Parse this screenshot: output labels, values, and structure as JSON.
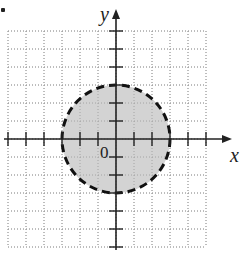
{
  "figure": {
    "bullet": true,
    "axes": {
      "x_label": "x",
      "y_label": "y",
      "origin_label": "0"
    },
    "grid": {
      "x_min": -6,
      "x_max": 5,
      "y_min": -6,
      "y_max": 6,
      "spacing_px": 18,
      "style": "dotted"
    },
    "circle": {
      "center": [
        0,
        0
      ],
      "radius": 3,
      "boundary": "dashed",
      "fill": "#d3d3d3",
      "inequality": "x^2 + y^2 < 9"
    },
    "colors": {
      "axis": "#222222",
      "grid": "#aaaaaa",
      "shade": "#d3d3d3"
    }
  },
  "chart_data": {
    "type": "region",
    "title": "",
    "xlabel": "x",
    "ylabel": "y",
    "xlim": [
      -6,
      5
    ],
    "ylim": [
      -6,
      6
    ],
    "grid": true,
    "shapes": [
      {
        "kind": "circle",
        "center": [
          0,
          0
        ],
        "radius": 3,
        "boundary": "dashed",
        "shaded": "inside"
      }
    ]
  }
}
